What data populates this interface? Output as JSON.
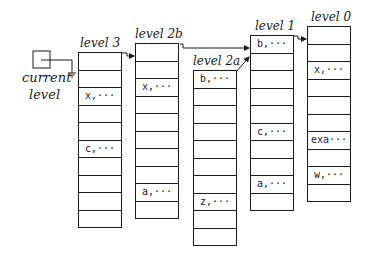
{
  "current_level": {
    "label_line1": "current",
    "label_line2": "level"
  },
  "levels": [
    {
      "id": "level3",
      "label": "level 3",
      "cells": [
        "",
        "",
        "x,···",
        "",
        "",
        "c,···",
        "",
        "",
        "",
        ""
      ]
    },
    {
      "id": "level2b",
      "label": "level 2b",
      "cells": [
        "",
        "",
        "x,···",
        "",
        "",
        "",
        "",
        "",
        "a,···",
        ""
      ]
    },
    {
      "id": "level2a",
      "label": "level 2a",
      "cells": [
        "b,···",
        "",
        "",
        "",
        "",
        "",
        "",
        "z,···",
        "",
        ""
      ]
    },
    {
      "id": "level1",
      "label": "level 1",
      "cells": [
        "b,···",
        "",
        "",
        "",
        "",
        "c,···",
        "",
        "",
        "a,···",
        ""
      ]
    },
    {
      "id": "level0",
      "label": "level 0",
      "cells": [
        "",
        "",
        "x,···",
        "",
        "",
        "",
        "exa···",
        "",
        "w,···",
        ""
      ]
    }
  ]
}
